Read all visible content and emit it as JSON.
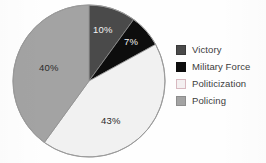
{
  "chart_data": {
    "type": "pie",
    "title": "",
    "subtitle": "",
    "xlabel": "",
    "ylabel": "",
    "legend_position": "right",
    "grid": false,
    "categories": [
      "Victory",
      "Military Force",
      "Politicization",
      "Policing"
    ],
    "values": [
      10,
      7,
      43,
      40
    ],
    "value_labels": [
      "10%",
      "7%",
      "43%",
      "40%"
    ],
    "colors": [
      "#4a4a4a",
      "#0d0d0d",
      "#f1f1f1",
      "#a3a3a3"
    ],
    "slices": [
      {
        "label": "Victory",
        "value": 10,
        "value_label": "10%",
        "color": "#4a4a4a",
        "label_color": "light",
        "label_x": 93,
        "label_y": 24
      },
      {
        "label": "Military Force",
        "value": 7,
        "value_label": "7%",
        "color": "#0d0d0d",
        "label_color": "light",
        "label_x": 124,
        "label_y": 36
      },
      {
        "label": "Politicization",
        "value": 43,
        "value_label": "43%",
        "color": "#f1f1f1",
        "label_color": "dark",
        "label_x": 101,
        "label_y": 115
      },
      {
        "label": "Policing",
        "value": 40,
        "value_label": "40%",
        "color": "#a3a3a3",
        "label_color": "dark",
        "label_x": 39,
        "label_y": 62
      }
    ],
    "start_angle_deg": 0,
    "direction": "clockwise"
  },
  "legend": {
    "items": [
      {
        "label": "Victory",
        "color": "#4a4a4a",
        "border": "#3a3a3a"
      },
      {
        "label": "Military Force",
        "color": "#0d0d0d",
        "border": "#0d0d0d"
      },
      {
        "label": "Politicization",
        "color": "#f4f0f1",
        "border": "#d8b9c0"
      },
      {
        "label": "Policing",
        "color": "#a3a3a3",
        "border": "#8d8d8d"
      }
    ]
  },
  "pie_geometry": {
    "cx": 89,
    "cy": 81,
    "r": 76,
    "outline_color": "#9a9a9a"
  }
}
